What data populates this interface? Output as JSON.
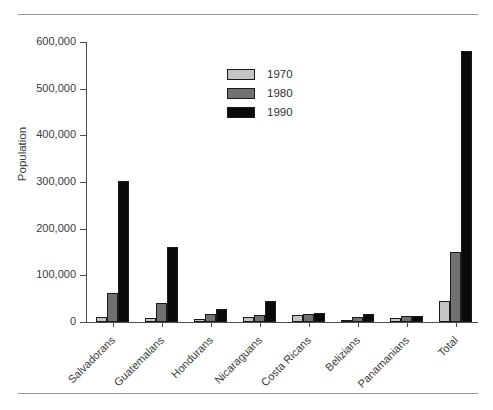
{
  "chart_data": {
    "type": "bar",
    "title": "",
    "subtitle": "",
    "xlabel": "",
    "ylabel": "Population",
    "ylim": [
      0,
      600000
    ],
    "yticks": [
      0,
      100000,
      200000,
      300000,
      400000,
      500000,
      600000
    ],
    "ytick_labels": [
      "0",
      "100,000",
      "200,000",
      "300,000",
      "400,000",
      "500,000",
      "600,000"
    ],
    "grid": false,
    "legend_position": "upper center",
    "legend_entries": [
      "1970",
      "1980",
      "1990"
    ],
    "categories": [
      "Salvadorans",
      "Guatemalans",
      "Hondurans",
      "Nicaraguans",
      "Costa Ricans",
      "Belizians",
      "Panamanians",
      "Total"
    ],
    "series": [
      {
        "name": "1970",
        "color": "#c4c4c4",
        "values": [
          10000,
          8000,
          7000,
          10000,
          14000,
          5000,
          8000,
          45000
        ]
      },
      {
        "name": "1980",
        "color": "#717171",
        "values": [
          62000,
          40000,
          17000,
          15000,
          17000,
          10000,
          12000,
          150000
        ]
      },
      {
        "name": "1990",
        "color": "#0a0a0a",
        "values": [
          303000,
          160000,
          28000,
          45000,
          20000,
          18000,
          13000,
          580000
        ]
      }
    ]
  },
  "figure": {
    "background_color": "#ffffff",
    "rule_color": "#9a9a9a",
    "axis_color": "#4d4d4d",
    "text_color": "#3a3a3a"
  }
}
